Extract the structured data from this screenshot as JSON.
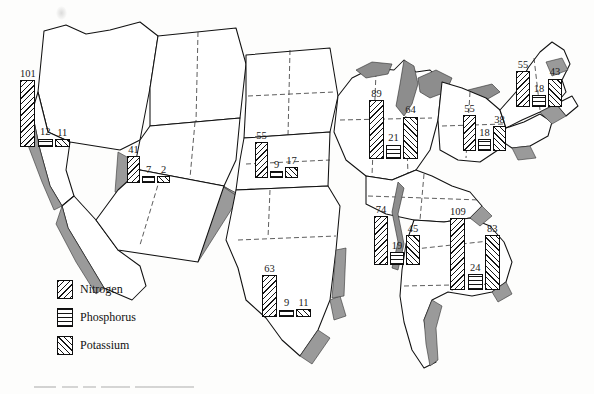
{
  "figure": {
    "type": "choropleth-map-with-bar-clusters",
    "region": "United States",
    "smudge_name": "scan-artifact"
  },
  "legend": {
    "items": [
      {
        "key": "nitrogen",
        "label": "Nitrogen",
        "pattern": "diagonal-backslash-hatch"
      },
      {
        "key": "phosphorus",
        "label": "Phosphorus",
        "pattern": "horizontal-lines"
      },
      {
        "key": "potassium",
        "label": "Potassium",
        "pattern": "diagonal-forward-hatch"
      }
    ]
  },
  "chart_data": {
    "type": "bar",
    "title": "",
    "xlabel": "",
    "ylabel": "",
    "series_names": [
      "Nitrogen",
      "Phosphorus",
      "Potassium"
    ],
    "note": "Grouped bars placed over U.S. regions; value labels printed above each bar",
    "groups": [
      {
        "name": "pacific",
        "values": [
          101,
          12,
          11
        ],
        "labels": [
          "101",
          "12",
          "11"
        ],
        "x": 20,
        "y": 66,
        "bar_width": 15,
        "scale": 0.66
      },
      {
        "name": "mountain",
        "values": [
          41,
          7,
          2
        ],
        "labels": [
          "41",
          "7",
          "2"
        ],
        "x": 127,
        "y": 142,
        "bar_width": 13,
        "scale": 0.66
      },
      {
        "name": "northern-plains",
        "values": [
          55,
          9,
          17
        ],
        "labels": [
          "55",
          "9",
          "17"
        ],
        "x": 255,
        "y": 128,
        "bar_width": 13,
        "scale": 0.66
      },
      {
        "name": "corn-belt",
        "values": [
          89,
          21,
          64
        ],
        "labels": [
          "89",
          "21",
          "64"
        ],
        "x": 369,
        "y": 86,
        "bar_width": 15,
        "scale": 0.66
      },
      {
        "name": "great-lakes-east",
        "values": [
          55,
          18,
          38
        ],
        "labels": [
          "55",
          "18",
          "38"
        ],
        "x": 463,
        "y": 101,
        "bar_width": 13,
        "scale": 0.66
      },
      {
        "name": "northeast",
        "values": [
          55,
          18,
          43
        ],
        "labels": [
          "55",
          "18",
          "43"
        ],
        "x": 516,
        "y": 57,
        "bar_width": 14,
        "scale": 0.66
      },
      {
        "name": "appalachian",
        "values": [
          74,
          19,
          45
        ],
        "labels": [
          "74",
          "19",
          "45"
        ],
        "x": 374,
        "y": 202,
        "bar_width": 14,
        "scale": 0.66
      },
      {
        "name": "southeast",
        "values": [
          109,
          24,
          83
        ],
        "labels": [
          "109",
          "24",
          "83"
        ],
        "x": 450,
        "y": 204,
        "bar_width": 15,
        "scale": 0.66
      },
      {
        "name": "southern-plains",
        "values": [
          63,
          9,
          11
        ],
        "labels": [
          "63",
          "9",
          "11"
        ],
        "x": 262,
        "y": 261,
        "bar_width": 15,
        "scale": 0.66
      }
    ]
  }
}
